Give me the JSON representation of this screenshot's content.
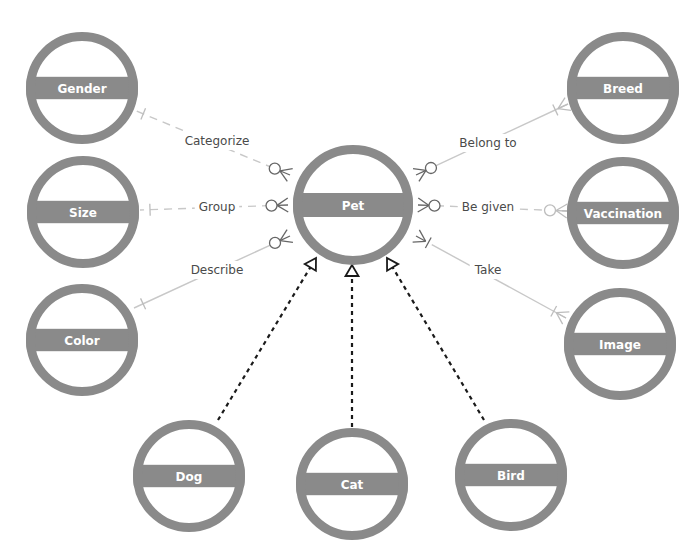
{
  "diagram": {
    "type": "entity-relationship",
    "colors": {
      "entity": "#8a8a8a",
      "entity_text": "#ffffff",
      "relationship_line": "#c8c8c8",
      "label_text": "#4a4a4a",
      "generalization_line": "#1a1a1a"
    },
    "central_entity": {
      "id": "pet",
      "label": "Pet"
    },
    "entities": [
      {
        "id": "gender",
        "label": "Gender"
      },
      {
        "id": "size",
        "label": "Size"
      },
      {
        "id": "color",
        "label": "Color"
      },
      {
        "id": "breed",
        "label": "Breed"
      },
      {
        "id": "vaccination",
        "label": "Vaccination"
      },
      {
        "id": "image",
        "label": "Image"
      },
      {
        "id": "dog",
        "label": "Dog"
      },
      {
        "id": "cat",
        "label": "Cat"
      },
      {
        "id": "bird",
        "label": "Bird"
      }
    ],
    "relationships": [
      {
        "from": "gender",
        "to": "pet",
        "label": "Categorize",
        "from_cardinality": "one",
        "to_cardinality": "zero-or-many",
        "line_style": "dashed"
      },
      {
        "from": "size",
        "to": "pet",
        "label": "Group",
        "from_cardinality": "one",
        "to_cardinality": "zero-or-many",
        "line_style": "dashed"
      },
      {
        "from": "color",
        "to": "pet",
        "label": "Describe",
        "from_cardinality": "one",
        "to_cardinality": "zero-or-many",
        "line_style": "solid"
      },
      {
        "from": "pet",
        "to": "breed",
        "label": "Belong to",
        "from_cardinality": "zero-or-many",
        "to_cardinality": "one-or-many",
        "line_style": "solid"
      },
      {
        "from": "pet",
        "to": "vaccination",
        "label": "Be given",
        "from_cardinality": "zero-or-many",
        "to_cardinality": "zero-or-many",
        "line_style": "dashed"
      },
      {
        "from": "pet",
        "to": "image",
        "label": "Take",
        "from_cardinality": "one-or-many",
        "to_cardinality": "one-or-many",
        "line_style": "solid"
      }
    ],
    "generalizations": [
      {
        "child": "dog",
        "parent": "pet"
      },
      {
        "child": "cat",
        "parent": "pet"
      },
      {
        "child": "bird",
        "parent": "pet"
      }
    ]
  }
}
